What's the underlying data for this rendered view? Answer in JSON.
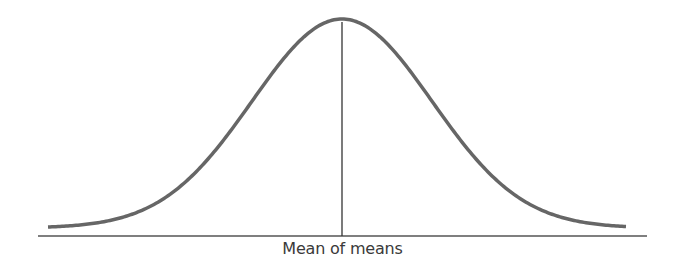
{
  "chart_data": {
    "type": "line",
    "title": "",
    "xlabel": "Mean of means",
    "ylabel": "",
    "grid": false,
    "legend": null,
    "series": [
      {
        "name": "sampling distribution",
        "distribution": "normal",
        "mean": 0,
        "sd": 1,
        "x_range_sd": [
          -3.2,
          3.2
        ]
      }
    ],
    "annotations": [
      {
        "type": "vline",
        "x": 0,
        "label": "Mean of means"
      }
    ],
    "colors": {
      "curve": "#666666",
      "axis": "#555555",
      "vline": "#333333"
    }
  },
  "labels": {
    "x_axis": "Mean of means"
  }
}
